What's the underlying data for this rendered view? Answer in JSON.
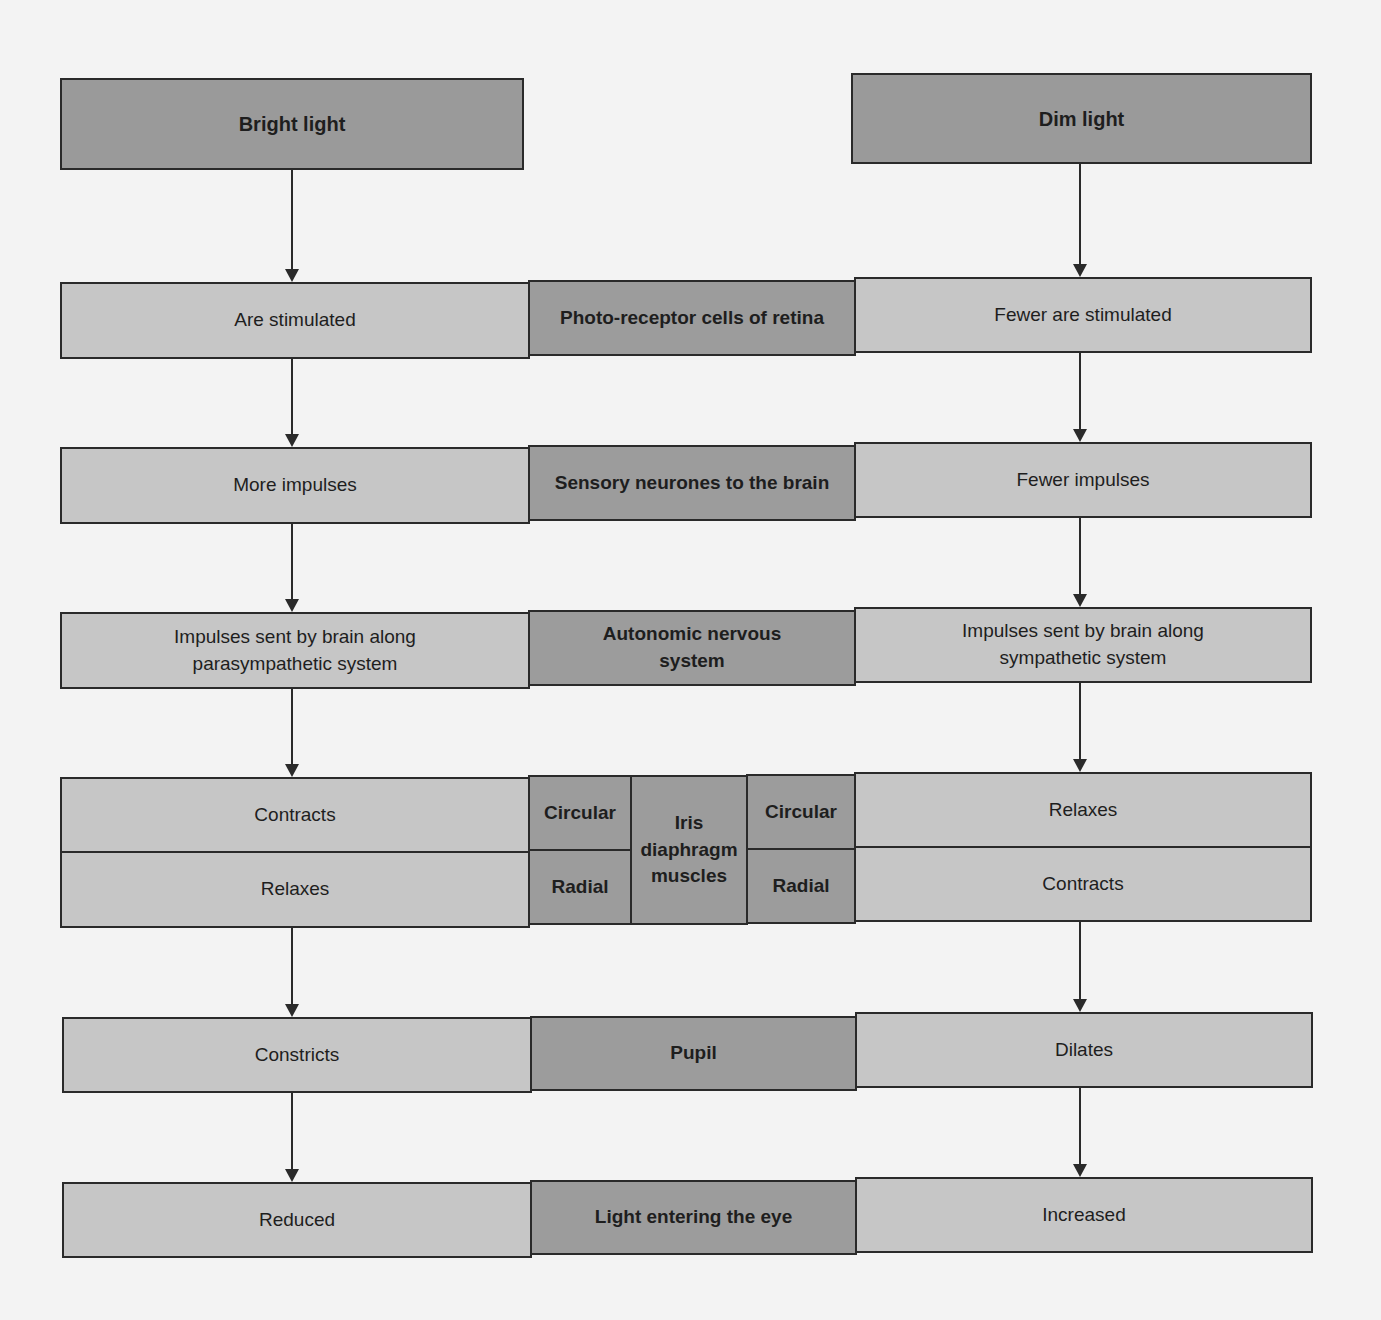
{
  "diagram": {
    "type": "flowchart",
    "colors": {
      "background": "#f3f3f3",
      "light_box": "#c6c6c6",
      "dark_box": "#9c9c9c",
      "line": "#2a2a2a"
    },
    "headers": {
      "left": "Bright light",
      "right": "Dim light"
    },
    "rows": [
      {
        "left": "Are stimulated",
        "center": "Photo-receptor cells of retina",
        "right": "Fewer are stimulated"
      },
      {
        "left": "More impulses",
        "center": "Sensory neurones to the brain",
        "right": "Fewer impulses"
      },
      {
        "left": "Impulses sent by brain along parasympathetic system",
        "center": "Autonomic nervous system",
        "right": "Impulses sent by brain along sympathetic system"
      },
      {
        "left_top": "Contracts",
        "left_bottom": "Relaxes",
        "center_left_top": "Circular",
        "center_left_bottom": "Radial",
        "center": "Iris diaphragm muscles",
        "center_right_top": "Circular",
        "center_right_bottom": "Radial",
        "right_top": "Relaxes",
        "right_bottom": "Contracts"
      },
      {
        "left": "Constricts",
        "center": "Pupil",
        "right": "Dilates"
      },
      {
        "left": "Reduced",
        "center": "Light entering the eye",
        "right": "Increased"
      }
    ]
  }
}
